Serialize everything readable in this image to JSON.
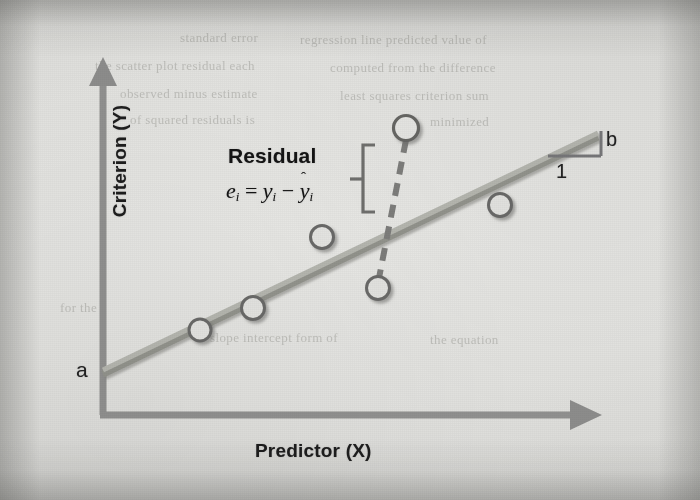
{
  "figure": {
    "title_visible": false,
    "axes": {
      "y_label": "Criterion (Y)",
      "x_label": "Predictor (X)"
    },
    "annotations": {
      "intercept": "a",
      "slope_rise": "b",
      "slope_run": "1",
      "residual_title": "Residual",
      "residual_formula_plain": "e_i = y_i − ŷ_i",
      "residual_e": "e",
      "residual_eq": "=",
      "residual_y": "y",
      "residual_minus": "−",
      "residual_yhat": "y",
      "residual_hat": "ˆ",
      "residual_sub": "i"
    },
    "colors": {
      "paper": "#e2e2df",
      "axis": "#8f8f8d",
      "regression_line": "#a9aaa3",
      "regression_line_shadow": "#8e8f88",
      "marker_fill": "#e6e6e3",
      "marker_stroke": "#6f6f6d",
      "dashed_residual": "#7d7d7b",
      "text": "#141414",
      "bracket": "#6e6e6c"
    },
    "ghost_text": [
      {
        "text": "standard error",
        "x": 180,
        "y": 30,
        "rotate": 0
      },
      {
        "text": "regression line predicted value of",
        "x": 300,
        "y": 32,
        "rotate": 0
      },
      {
        "text": "the scatter plot residual each",
        "x": 95,
        "y": 58,
        "rotate": 0
      },
      {
        "text": "computed from the difference",
        "x": 330,
        "y": 60,
        "rotate": 0
      },
      {
        "text": "observed minus estimate",
        "x": 120,
        "y": 86,
        "rotate": 0
      },
      {
        "text": "least squares criterion sum",
        "x": 340,
        "y": 88,
        "rotate": 0
      },
      {
        "text": "of squared residuals is",
        "x": 130,
        "y": 112,
        "rotate": 0
      },
      {
        "text": "minimized",
        "x": 430,
        "y": 114,
        "rotate": 0
      },
      {
        "text": "slope intercept form of",
        "x": 210,
        "y": 330,
        "rotate": 0
      },
      {
        "text": "the equation",
        "x": 430,
        "y": 332,
        "rotate": 0
      },
      {
        "text": "for the",
        "x": 60,
        "y": 300,
        "rotate": 0
      }
    ]
  },
  "chart_data": {
    "type": "scatter",
    "xlabel": "Predictor (X)",
    "ylabel": "Criterion (Y)",
    "grid": false,
    "legend": "none",
    "axis_style": "arrow",
    "xlim": [
      0,
      100
    ],
    "ylim": [
      0,
      100
    ],
    "points": [
      {
        "id": "p1",
        "px": 200,
        "py": 330
      },
      {
        "id": "p2",
        "px": 253,
        "py": 308
      },
      {
        "id": "p3",
        "px": 322,
        "py": 237
      },
      {
        "id": "p4",
        "px": 406,
        "py": 128
      },
      {
        "id": "p5",
        "px": 378,
        "py": 288
      },
      {
        "id": "p6",
        "px": 500,
        "py": 205
      }
    ],
    "fit_line": {
      "label": "regression line",
      "intercept_label": "a",
      "slope_label": "b",
      "run_label": "1",
      "px_start": {
        "x": 103,
        "y": 370
      },
      "px_end": {
        "x": 598,
        "y": 133
      }
    },
    "residual_segment": {
      "label": "Residual",
      "from_point": "p4",
      "px_top": {
        "x": 406,
        "y": 140
      },
      "px_bottom": {
        "x": 379,
        "y": 278
      },
      "style": "dashed"
    }
  }
}
